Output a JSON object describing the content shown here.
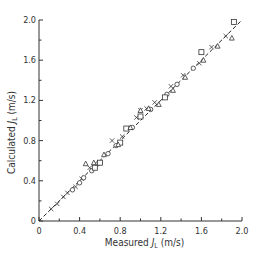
{
  "chart_data": {
    "type": "scatter",
    "title": "",
    "xlabel": "Measured J_L (m/s)",
    "ylabel": "Calculated J_L (m/s)",
    "xlabel_parts": {
      "pre": "Measured ",
      "sym": "J",
      "sub": "L",
      "post": " (m/s)"
    },
    "ylabel_parts": {
      "pre": "Calculated ",
      "sym": "J",
      "sub": "L",
      "post": " (m/s)"
    },
    "xlim": [
      0,
      2.0
    ],
    "ylim": [
      0,
      2.0
    ],
    "xticks": [
      0,
      0.4,
      0.8,
      1.2,
      1.6,
      2.0
    ],
    "xtick_labels": [
      "0",
      "0.4",
      "0.8",
      "1.2",
      "1.6",
      "2.0"
    ],
    "yticks": [
      0,
      0.4,
      0.8,
      1.2,
      1.6,
      2.0
    ],
    "ytick_labels": [
      "0",
      "0.4",
      "0.8",
      "1.2",
      "1.6",
      "2.0"
    ],
    "minor_ticks": [
      0.2,
      0.6,
      1.0,
      1.4,
      1.8
    ],
    "grid": false,
    "legend": null,
    "reference_line": {
      "style": "dashed",
      "from": [
        0,
        0
      ],
      "to": [
        2.0,
        2.0
      ],
      "label": "y = x"
    },
    "series": [
      {
        "name": "crosses",
        "marker": "x",
        "points": [
          [
            0.12,
            0.12
          ],
          [
            0.18,
            0.17
          ],
          [
            0.24,
            0.24
          ],
          [
            0.28,
            0.28
          ],
          [
            0.36,
            0.34
          ],
          [
            0.42,
            0.42
          ],
          [
            0.5,
            0.53
          ],
          [
            0.72,
            0.8
          ],
          [
            0.82,
            0.84
          ],
          [
            0.96,
            1.03
          ],
          [
            1.0,
            1.1
          ],
          [
            1.06,
            1.12
          ],
          [
            1.14,
            1.18
          ],
          [
            1.3,
            1.34
          ],
          [
            1.42,
            1.45
          ],
          [
            1.58,
            1.57
          ],
          [
            1.7,
            1.73
          ],
          [
            1.84,
            1.84
          ]
        ]
      },
      {
        "name": "circles",
        "marker": "o",
        "points": [
          [
            0.33,
            0.31
          ],
          [
            0.4,
            0.38
          ],
          [
            0.44,
            0.43
          ],
          [
            0.52,
            0.5
          ],
          [
            0.58,
            0.57
          ],
          [
            0.68,
            0.67
          ],
          [
            0.76,
            0.75
          ],
          [
            0.92,
            0.93
          ],
          [
            1.1,
            1.11
          ],
          [
            1.26,
            1.26
          ],
          [
            1.36,
            1.36
          ],
          [
            1.52,
            1.52
          ]
        ]
      },
      {
        "name": "squares",
        "marker": "s",
        "points": [
          [
            0.55,
            0.53
          ],
          [
            0.6,
            0.58
          ],
          [
            0.8,
            0.78
          ],
          [
            0.86,
            0.92
          ],
          [
            1.0,
            1.04
          ],
          [
            1.24,
            1.23
          ],
          [
            1.6,
            1.68
          ],
          [
            1.92,
            1.98
          ]
        ]
      },
      {
        "name": "triangles",
        "marker": "^",
        "points": [
          [
            0.46,
            0.57
          ],
          [
            0.54,
            0.58
          ],
          [
            0.64,
            0.66
          ],
          [
            0.78,
            0.76
          ],
          [
            0.9,
            0.93
          ],
          [
            1.0,
            1.1
          ],
          [
            1.08,
            1.12
          ],
          [
            1.18,
            1.16
          ],
          [
            1.32,
            1.3
          ],
          [
            1.44,
            1.43
          ],
          [
            1.62,
            1.6
          ],
          [
            1.76,
            1.74
          ],
          [
            1.9,
            1.82
          ]
        ]
      }
    ]
  }
}
